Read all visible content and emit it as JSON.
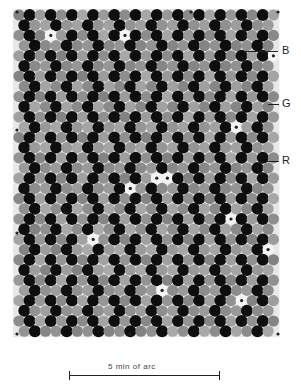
{
  "figure": {
    "type": "cone photoreceptor mosaic",
    "labels": [
      {
        "text": "B",
        "x": 282,
        "y": 45,
        "line_x1": 244,
        "line_x2": 278,
        "line_y": 51
      },
      {
        "text": "G",
        "x": 282,
        "y": 98,
        "line_x1": 268,
        "line_x2": 279,
        "line_y": 104
      },
      {
        "text": "R",
        "x": 282,
        "y": 155,
        "line_x1": 267,
        "line_x2": 279,
        "line_y": 161
      }
    ],
    "scale_bar": {
      "label": "5 min of arc",
      "x1": 69,
      "x2": 219
    }
  },
  "mosaic": {
    "x0": 19,
    "y0": 15,
    "dx": 10.6,
    "dy": 10.2,
    "rows": 32,
    "cols": 25,
    "radius": 5.6,
    "colors": {
      "red_cone": "#8c8c8c",
      "green_cone": "#0e0e0e",
      "blue_cone": "#f4f4f4",
      "background": "#e8e8e8"
    },
    "blue_cones": [
      [
        49,
        37
      ],
      [
        270,
        52
      ],
      [
        128,
        37
      ],
      [
        237,
        131
      ],
      [
        162,
        174
      ],
      [
        234,
        215
      ],
      [
        95,
        240
      ],
      [
        268,
        248
      ],
      [
        237,
        296
      ],
      [
        162,
        294
      ],
      [
        128,
        185
      ]
    ],
    "dots": [
      [
        17,
        12
      ],
      [
        191,
        12
      ],
      [
        278,
        12
      ],
      [
        17,
        130
      ],
      [
        17,
        233
      ],
      [
        17,
        334
      ],
      [
        130,
        334
      ],
      [
        278,
        334
      ]
    ]
  }
}
